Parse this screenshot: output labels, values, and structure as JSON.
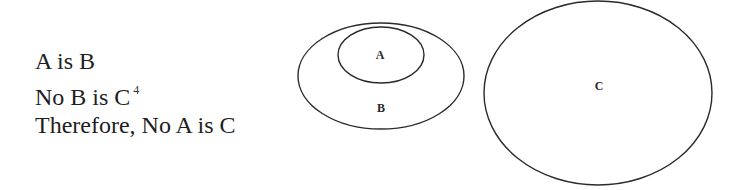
{
  "syllogism": {
    "premise_1": "A is B",
    "premise_2": "No B is C",
    "premise_2_footnote": "4",
    "conclusion": "Therefore, No A is C"
  },
  "diagram": {
    "sets": [
      {
        "label": "A",
        "relation": "contained in B"
      },
      {
        "label": "B",
        "relation": "contains A, disjoint from C"
      },
      {
        "label": "C",
        "relation": "disjoint from B"
      }
    ],
    "labels": {
      "a": "A",
      "b": "B",
      "c": "C"
    },
    "stroke_color": "#2a2a2a"
  }
}
